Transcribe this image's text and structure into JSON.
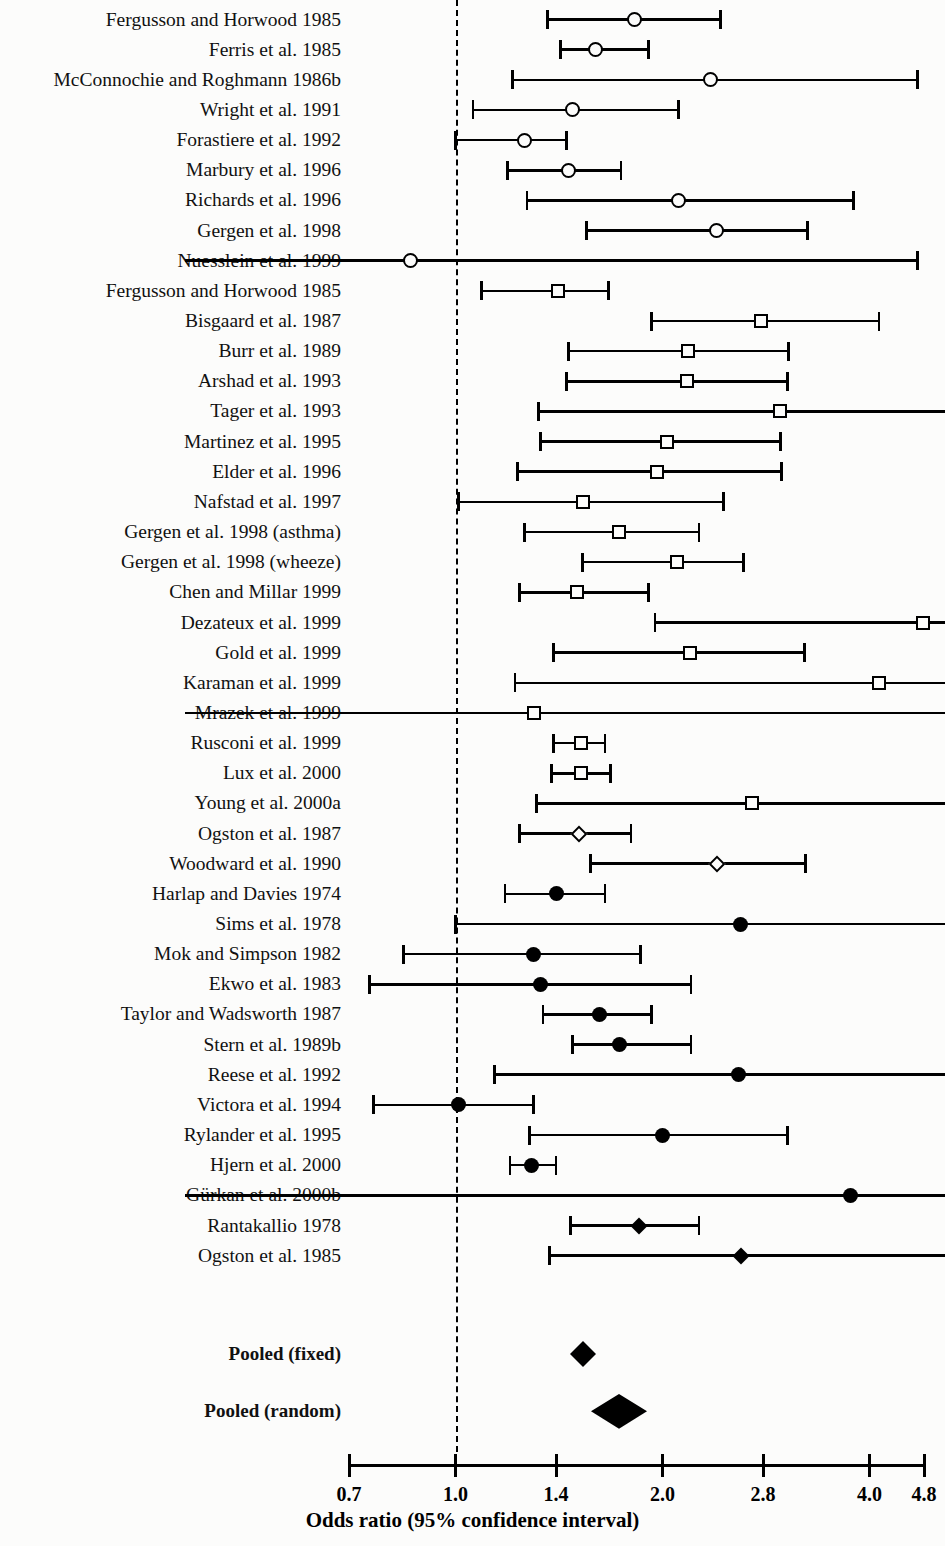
{
  "chart_data": {
    "type": "scatter",
    "plot_kind": "forest-plot",
    "title": "",
    "xlabel": "Odds ratio (95% confidence interval)",
    "ylabel": "",
    "xscale": "log",
    "xlim": [
      0.7,
      4.8
    ],
    "xticks": [
      "0.7",
      "1.0",
      "1.4",
      "2.0",
      "2.8",
      "4.0",
      "4.8"
    ],
    "xtick_values": [
      0.7,
      1.0,
      1.4,
      2.0,
      2.8,
      4.0,
      4.8
    ],
    "grid": false,
    "legend": "none",
    "null_line": 1.0,
    "marker_legend": [
      {
        "symbol": "open-circle",
        "meaning": "open circle study"
      },
      {
        "symbol": "open-square",
        "meaning": "open square study"
      },
      {
        "symbol": "open-diamond",
        "meaning": "open diamond study"
      },
      {
        "symbol": "filled-circle",
        "meaning": "filled circle study"
      },
      {
        "symbol": "filled-diamond",
        "meaning": "filled diamond study"
      },
      {
        "symbol": "pooled-diamond",
        "meaning": "pooled estimate"
      }
    ],
    "studies": [
      {
        "label": "Fergusson and Horwood 1985",
        "or": 1.82,
        "lo": 1.36,
        "hi": 2.43,
        "marker": "open-circle"
      },
      {
        "label": "Ferris et al. 1985",
        "or": 1.6,
        "lo": 1.42,
        "hi": 1.91,
        "marker": "open-circle"
      },
      {
        "label": "McConnochie and Roghmann 1986b",
        "or": 2.35,
        "lo": 1.21,
        "hi": 4.7,
        "marker": "open-circle"
      },
      {
        "label": "Wright et al. 1991",
        "or": 1.48,
        "lo": 1.06,
        "hi": 2.11,
        "marker": "open-circle"
      },
      {
        "label": "Forastiere et al. 1992",
        "or": 1.26,
        "lo": 1.0,
        "hi": 1.45,
        "marker": "open-circle"
      },
      {
        "label": "Marbury et al. 1996",
        "or": 1.46,
        "lo": 1.19,
        "hi": 1.74,
        "marker": "open-circle"
      },
      {
        "label": "Richards et al. 1996",
        "or": 2.11,
        "lo": 1.27,
        "hi": 3.79,
        "marker": "open-circle"
      },
      {
        "label": "Gergen et al. 1998",
        "or": 2.4,
        "lo": 1.55,
        "hi": 3.25,
        "marker": "open-circle"
      },
      {
        "label": "Nuesslein et al. 1999",
        "or": 0.86,
        "lo": 0.5,
        "hi": 4.7,
        "marker": "open-circle",
        "lo_offscale": true
      },
      {
        "label": "Fergusson and Horwood 1985",
        "or": 1.41,
        "lo": 1.09,
        "hi": 1.67,
        "marker": "open-square"
      },
      {
        "label": "Bisgaard et al. 1987",
        "or": 2.78,
        "lo": 1.93,
        "hi": 4.13,
        "marker": "open-square"
      },
      {
        "label": "Burr et al. 1989",
        "or": 2.18,
        "lo": 1.46,
        "hi": 3.05,
        "marker": "open-square"
      },
      {
        "label": "Arshad et al. 1993",
        "or": 2.17,
        "lo": 1.45,
        "hi": 3.04,
        "marker": "open-square"
      },
      {
        "label": "Tager et al. 1993",
        "or": 2.96,
        "lo": 1.32,
        "hi": 5.1,
        "marker": "open-square",
        "hi_offscale": true
      },
      {
        "label": "Martinez et al. 1995",
        "or": 2.03,
        "lo": 1.33,
        "hi": 2.97,
        "marker": "open-square"
      },
      {
        "label": "Elder et al. 1996",
        "or": 1.96,
        "lo": 1.23,
        "hi": 2.98,
        "marker": "open-square"
      },
      {
        "label": "Nafstad et al. 1997",
        "or": 1.53,
        "lo": 1.01,
        "hi": 2.45,
        "marker": "open-square"
      },
      {
        "label": "Gergen et al. 1998 (asthma)",
        "or": 1.73,
        "lo": 1.26,
        "hi": 2.26,
        "marker": "open-square"
      },
      {
        "label": "Gergen et al. 1998 (wheeze)",
        "or": 2.1,
        "lo": 1.53,
        "hi": 2.62,
        "marker": "open-square"
      },
      {
        "label": "Chen and Millar 1999",
        "or": 1.5,
        "lo": 1.24,
        "hi": 1.91,
        "marker": "open-square"
      },
      {
        "label": "Dezateux et al. 1999",
        "or": 4.78,
        "lo": 1.95,
        "hi": 5.1,
        "marker": "open-square",
        "hi_offscale": true
      },
      {
        "label": "Gold et al. 1999",
        "or": 2.19,
        "lo": 1.39,
        "hi": 3.22,
        "marker": "open-square"
      },
      {
        "label": "Karaman et al. 1999",
        "or": 4.13,
        "lo": 1.22,
        "hi": 5.1,
        "marker": "open-square",
        "hi_offscale": true
      },
      {
        "label": "Mrazek et al. 1999",
        "or": 1.3,
        "lo": 0.5,
        "hi": 5.1,
        "marker": "open-square",
        "lo_offscale": true,
        "hi_offscale": true
      },
      {
        "label": "Rusconi et al. 1999",
        "or": 1.52,
        "lo": 1.39,
        "hi": 1.65,
        "marker": "open-square"
      },
      {
        "label": "Lux et al. 2000",
        "or": 1.52,
        "lo": 1.38,
        "hi": 1.68,
        "marker": "open-square"
      },
      {
        "label": "Young et al. 2000a",
        "or": 2.7,
        "lo": 1.31,
        "hi": 5.1,
        "marker": "open-square",
        "hi_offscale": true
      },
      {
        "label": "Ogston et al. 1987",
        "or": 1.51,
        "lo": 1.24,
        "hi": 1.8,
        "marker": "open-diamond"
      },
      {
        "label": "Woodward et al. 1990",
        "or": 2.4,
        "lo": 1.57,
        "hi": 3.23,
        "marker": "open-diamond"
      },
      {
        "label": "Harlap and Davies 1974",
        "or": 1.4,
        "lo": 1.18,
        "hi": 1.65,
        "marker": "filled-circle"
      },
      {
        "label": "Sims et al. 1978",
        "or": 2.6,
        "lo": 1.0,
        "hi": 5.1,
        "marker": "filled-circle",
        "hi_offscale": true
      },
      {
        "label": "Mok and Simpson 1982",
        "or": 1.3,
        "lo": 0.84,
        "hi": 1.86,
        "marker": "filled-circle"
      },
      {
        "label": "Ekwo et al. 1983",
        "or": 1.33,
        "lo": 0.75,
        "hi": 2.2,
        "marker": "filled-circle"
      },
      {
        "label": "Taylor and Wadsworth 1987",
        "or": 1.62,
        "lo": 1.34,
        "hi": 1.93,
        "marker": "filled-circle"
      },
      {
        "label": "Stern et al. 1989b",
        "or": 1.73,
        "lo": 1.48,
        "hi": 2.2,
        "marker": "filled-circle"
      },
      {
        "label": "Reese et al. 1992",
        "or": 2.58,
        "lo": 1.14,
        "hi": 5.1,
        "marker": "filled-circle",
        "hi_offscale": true
      },
      {
        "label": "Victora et al. 1994",
        "or": 1.01,
        "lo": 0.76,
        "hi": 1.3,
        "marker": "filled-circle"
      },
      {
        "label": "Rylander et al. 1995",
        "or": 2.0,
        "lo": 1.28,
        "hi": 3.04,
        "marker": "filled-circle"
      },
      {
        "label": "Hjern et al. 2000",
        "or": 1.29,
        "lo": 1.2,
        "hi": 1.4,
        "marker": "filled-circle"
      },
      {
        "label": "Gürkan et al. 2000b",
        "or": 3.75,
        "lo": 0.5,
        "hi": 5.1,
        "marker": "filled-circle",
        "lo_offscale": true,
        "hi_offscale": true
      },
      {
        "label": "Rantakallio 1978",
        "or": 1.85,
        "lo": 1.47,
        "hi": 2.26,
        "marker": "filled-diamond"
      },
      {
        "label": "Ogston et al. 1985",
        "or": 2.6,
        "lo": 1.37,
        "hi": 5.1,
        "marker": "filled-diamond",
        "hi_offscale": true
      }
    ],
    "pooled": [
      {
        "label": "Pooled (fixed)",
        "or": 1.53,
        "lo": 1.47,
        "hi": 1.6,
        "marker": "pooled-diamond",
        "half_width_px": 13
      },
      {
        "label": "Pooled (random)",
        "or": 1.73,
        "lo": 1.5,
        "hi": 2.0,
        "marker": "pooled-diamond",
        "half_width_px": 28
      }
    ]
  },
  "axis": {
    "title": "Odds ratio (95% confidence interval)",
    "ticks": [
      "0.7",
      "1.0",
      "1.4",
      "2.0",
      "2.8",
      "4.0",
      "4.8"
    ]
  }
}
